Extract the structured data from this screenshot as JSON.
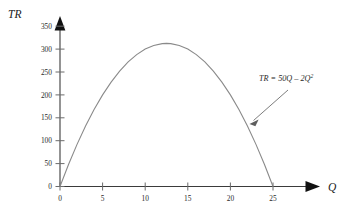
{
  "figure": {
    "caption": "",
    "background": "#ffffff",
    "curve_color": "#8a8a8a",
    "axis_color": "#3b3b3b",
    "text_color": "#2a2a2a"
  },
  "axes": {
    "y_axis_label": "TR",
    "x_axis_label": "Q",
    "y_ticks": [
      "0",
      "50",
      "100",
      "150",
      "200",
      "250",
      "300",
      "350"
    ],
    "x_ticks": [
      "0",
      "5",
      "10",
      "15",
      "20",
      "25"
    ]
  },
  "annotation": {
    "prefix": "TR = 50Q – 2Q",
    "exponent": "2",
    "full_text": "TR = 50Q – 2Q2"
  },
  "chart_data": {
    "type": "line",
    "title": "",
    "subtitle": "",
    "xlabel": "Q",
    "ylabel": "TR",
    "xlim": [
      0,
      28
    ],
    "ylim": [
      0,
      350
    ],
    "grid": false,
    "legend": null,
    "equation": "TR = 50Q - 2Q^2",
    "x_tick_values": [
      0,
      5,
      10,
      15,
      20,
      25
    ],
    "y_tick_values": [
      0,
      50,
      100,
      150,
      200,
      250,
      300,
      350
    ],
    "series": [
      {
        "name": "TR = 50Q - 2Q^2",
        "color": "#8a8a8a",
        "x": [
          0,
          1,
          2,
          3,
          4,
          5,
          6,
          7,
          8,
          9,
          10,
          11,
          12,
          12.5,
          13,
          14,
          15,
          16,
          17,
          18,
          19,
          20,
          21,
          22,
          23,
          24,
          25
        ],
        "values": [
          0,
          48,
          92,
          132,
          168,
          200,
          228,
          252,
          272,
          288,
          300,
          308,
          312,
          312.5,
          312,
          308,
          300,
          288,
          272,
          252,
          228,
          200,
          168,
          132,
          92,
          48,
          0
        ]
      }
    ],
    "annotations": [
      {
        "text": "TR = 50Q - 2Q^2",
        "points_to_x": 22.3,
        "points_to_y": 128
      }
    ],
    "vertex": {
      "x": 12.5,
      "y": 312.5
    },
    "roots": [
      0,
      25
    ]
  }
}
